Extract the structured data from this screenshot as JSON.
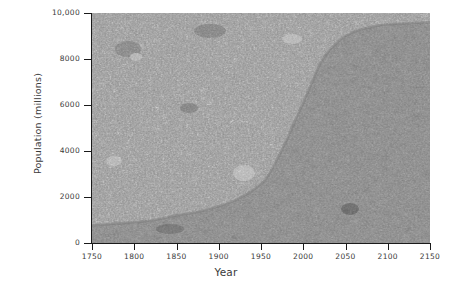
{
  "chart_data": {
    "type": "area",
    "title": "",
    "subtitle": "",
    "xlabel": "Year",
    "ylabel": "Population (millions)",
    "xlim": [
      1750,
      2150
    ],
    "ylim": [
      0,
      10000
    ],
    "grid": false,
    "legend": null,
    "x_ticks": [
      "1750",
      "1800",
      "1850",
      "1900",
      "1950",
      "2000",
      "2050",
      "2100",
      "2150"
    ],
    "x_tick_values": [
      1750,
      1800,
      1850,
      1900,
      1950,
      2000,
      2050,
      2100,
      2150
    ],
    "y_ticks": [
      "0",
      "2000",
      "4000",
      "6000",
      "8000",
      "10,000"
    ],
    "y_tick_values": [
      0,
      2000,
      4000,
      6000,
      8000,
      10000
    ],
    "series": [
      {
        "name": "World population",
        "x": [
          1750,
          1775,
          1800,
          1825,
          1850,
          1875,
          1900,
          1925,
          1950,
          1960,
          1970,
          1975,
          1980,
          1990,
          2000,
          2010,
          2025,
          2050,
          2075,
          2100,
          2125,
          2150
        ],
        "values": [
          760,
          830,
          900,
          1000,
          1200,
          1350,
          1600,
          1950,
          2550,
          3020,
          3700,
          4070,
          4450,
          5300,
          6100,
          6950,
          8100,
          9000,
          9350,
          9500,
          9550,
          9600
        ]
      }
    ],
    "fill_above_color": "#a8a8a8",
    "fill_below_color": "#6e6e6e",
    "axis_color": "#1a1a1a",
    "text_color": "#3a3a3a",
    "background_color": "#ffffff",
    "annotations": []
  }
}
